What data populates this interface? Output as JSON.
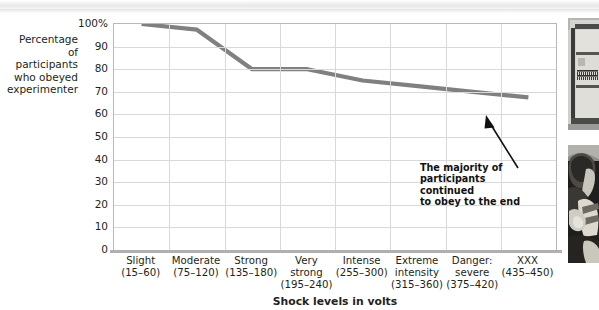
{
  "figure": {
    "left_axis_title": "Percentage\nof participants\nwho obeyed\nexperimenter",
    "left_axis_title_lines": [
      "Percentage",
      "of participants",
      "who obeyed",
      "experimenter"
    ],
    "x_axis_title": "Shock levels in volts",
    "annotation_lines": [
      "The majority of",
      "participants continued",
      "to obey to the end"
    ],
    "annotation": "The majority of participants continued to obey to the end",
    "line_color": "#808080",
    "grid_color": "#d9d9d9",
    "frame_color": "#b8b8b8"
  },
  "photos": [
    {
      "name": "shock-generator-photo",
      "caption": ""
    },
    {
      "name": "learner-strapped-photo",
      "caption": ""
    }
  ],
  "chart_data": {
    "type": "line",
    "title": "",
    "xlabel": "Shock levels in volts",
    "ylabel": "Percentage of participants who obeyed experimenter",
    "ylim": [
      0,
      100
    ],
    "yticks": [
      0,
      10,
      20,
      30,
      40,
      50,
      60,
      70,
      80,
      90,
      100
    ],
    "ytick_labels": [
      "0",
      "10",
      "20",
      "30",
      "40",
      "50",
      "60",
      "70",
      "80",
      "90",
      "100%"
    ],
    "grid": true,
    "legend": "none",
    "categories": [
      "Slight\n(15–60)",
      "Moderate\n(75–120)",
      "Strong\n(135–180)",
      "Very\nstrong\n(195–240)",
      "Intense\n(255–300)",
      "Extreme\nintensity\n(315–360)",
      "Danger:\nsevere\n(375–420)",
      "XXX\n(435–450)"
    ],
    "category_lines": [
      [
        "Slight",
        "(15–60)"
      ],
      [
        "Moderate",
        "(75–120)"
      ],
      [
        "Strong",
        "(135–180)"
      ],
      [
        "Very",
        "strong",
        "(195–240)"
      ],
      [
        "Intense",
        "(255–300)"
      ],
      [
        "Extreme",
        "intensity",
        "(315–360)"
      ],
      [
        "Danger:",
        "severe",
        "(375–420)"
      ],
      [
        "XXX",
        "(435–450)"
      ]
    ],
    "values": [
      100,
      97.5,
      80,
      80,
      75,
      72.5,
      70,
      67.5
    ]
  }
}
